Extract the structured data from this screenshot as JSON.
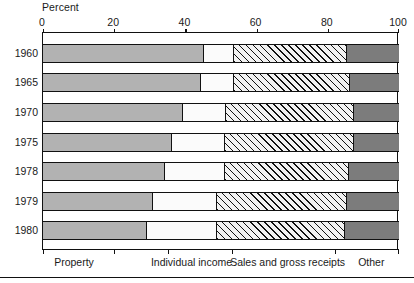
{
  "chart_data": {
    "type": "bar",
    "subtype": "stacked-horizontal-100percent",
    "title": "",
    "xlabel": "Percent",
    "ylabel": "",
    "xlim": [
      0,
      100
    ],
    "xticks": [
      0,
      20,
      40,
      60,
      80,
      100
    ],
    "xtick_labels": [
      "0",
      "20",
      "40",
      "60",
      "80",
      "100"
    ],
    "grid": false,
    "legend_position": "bottom",
    "categories": [
      "1960",
      "1965",
      "1970",
      "1975",
      "1978",
      "1979",
      "1980"
    ],
    "series": [
      {
        "name": "Property",
        "fill": "solid-gray",
        "color": "#b2b2b2",
        "values": [
          45.2,
          44.4,
          39.3,
          36.2,
          34.2,
          30.9,
          29.2
        ]
      },
      {
        "name": "Individual income",
        "fill": "white",
        "color": "#fbfbfb",
        "values": [
          8.5,
          9.3,
          12.1,
          14.9,
          16.9,
          18.0,
          19.7
        ]
      },
      {
        "name": "Sales and gross receipts",
        "fill": "diagonal-hatch",
        "color": "#f2f2f2",
        "values": [
          31.7,
          32.5,
          35.9,
          36.2,
          34.8,
          36.5,
          35.9
        ]
      },
      {
        "name": "Other",
        "fill": "dark-gray",
        "color": "#7c7c7c",
        "values": [
          14.6,
          13.8,
          12.7,
          12.7,
          14.1,
          14.6,
          15.2
        ]
      }
    ],
    "cumulative_boundaries": [
      [
        45.2,
        53.7,
        85.4
      ],
      [
        44.4,
        53.7,
        86.2
      ],
      [
        39.3,
        51.4,
        87.3
      ],
      [
        36.2,
        51.1,
        87.3
      ],
      [
        34.2,
        51.1,
        85.9
      ],
      [
        30.9,
        48.9,
        85.4
      ],
      [
        29.2,
        48.9,
        84.8
      ]
    ]
  },
  "axis": {
    "percent_title": "Percent",
    "ticks": [
      {
        "label": "0",
        "value": 0
      },
      {
        "label": "20",
        "value": 20
      },
      {
        "label": "40",
        "value": 40
      },
      {
        "label": "60",
        "value": 60
      },
      {
        "label": "80",
        "value": 80
      },
      {
        "label": "100",
        "value": 100
      }
    ]
  },
  "legend": {
    "items": [
      {
        "label": "Property",
        "center": 9
      },
      {
        "label": "Individual income",
        "center": 42
      },
      {
        "label": "Sales and gross receipts",
        "center": 69
      },
      {
        "label": "Other",
        "center": 92.5
      }
    ],
    "tick_values": [
      0,
      20,
      35,
      53,
      82,
      100
    ]
  }
}
